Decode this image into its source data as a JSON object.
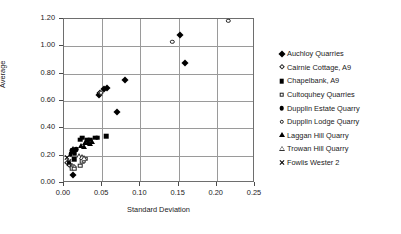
{
  "chart_data": {
    "type": "scatter",
    "title": "",
    "xlabel": "Standard Deviation",
    "ylabel": "Average",
    "xlim": [
      0.0,
      0.25
    ],
    "ylim": [
      0.0,
      1.2
    ],
    "xticks": [
      "0.00",
      "0.05",
      "0.10",
      "0.15",
      "0.20",
      "0.25"
    ],
    "yticks": [
      "0.00",
      "0.20",
      "0.40",
      "0.60",
      "0.80",
      "1.00",
      "1.20"
    ],
    "xtick_values": [
      0.0,
      0.05,
      0.1,
      0.15,
      0.2,
      0.25
    ],
    "ytick_values": [
      0.0,
      0.2,
      0.4,
      0.6,
      0.8,
      1.0,
      1.2
    ],
    "grid": true,
    "legend_position": "right",
    "series": [
      {
        "name": "Auchloy Quarries",
        "marker": "filled-diamond",
        "color": "#000000",
        "points": [
          [
            0.012,
            0.055
          ],
          [
            0.046,
            0.645
          ],
          [
            0.047,
            0.66
          ],
          [
            0.053,
            0.69
          ],
          [
            0.056,
            0.695
          ],
          [
            0.07,
            0.522
          ],
          [
            0.08,
            0.752
          ],
          [
            0.152,
            1.082
          ],
          [
            0.159,
            0.878
          ]
        ]
      },
      {
        "name": "Cairnie Cottage, A9",
        "marker": "open-diamond",
        "color": "#222222",
        "points": [
          [
            0.004,
            0.15
          ],
          [
            0.006,
            0.142
          ],
          [
            0.008,
            0.128
          ],
          [
            0.01,
            0.122
          ],
          [
            0.013,
            0.118
          ],
          [
            0.049,
            0.662
          ]
        ]
      },
      {
        "name": "Chapelbank, A9",
        "marker": "filled-square",
        "color": "#000000",
        "points": [
          [
            0.01,
            0.228
          ],
          [
            0.012,
            0.232
          ],
          [
            0.014,
            0.218
          ],
          [
            0.013,
            0.175
          ],
          [
            0.021,
            0.318
          ],
          [
            0.024,
            0.33
          ],
          [
            0.03,
            0.312
          ],
          [
            0.034,
            0.318
          ],
          [
            0.041,
            0.33
          ],
          [
            0.044,
            0.33
          ],
          [
            0.055,
            0.342
          ]
        ]
      },
      {
        "name": "Cultoquhey Quarries",
        "marker": "open-square",
        "color": "#222222",
        "points": [
          [
            0.01,
            0.11
          ],
          [
            0.013,
            0.105
          ],
          [
            0.021,
            0.128
          ],
          [
            0.024,
            0.16
          ],
          [
            0.026,
            0.162
          ],
          [
            0.028,
            0.178
          ]
        ]
      },
      {
        "name": "Dupplin Estate Quarry",
        "marker": "filled-circle",
        "color": "#000000",
        "points": [
          [
            0.009,
            0.212
          ],
          [
            0.011,
            0.238
          ],
          [
            0.016,
            0.248
          ]
        ]
      },
      {
        "name": "Dupplin Lodge Quarry",
        "marker": "open-circle",
        "color": "#222222",
        "points": [
          [
            0.007,
            0.132
          ],
          [
            0.142,
            1.032
          ],
          [
            0.215,
            1.188
          ]
        ]
      },
      {
        "name": "Laggan Hill Quarry",
        "marker": "filled-triangle",
        "color": "#000000",
        "points": [
          [
            0.01,
            0.236
          ],
          [
            0.012,
            0.246
          ],
          [
            0.014,
            0.24
          ],
          [
            0.022,
            0.272
          ],
          [
            0.026,
            0.262
          ],
          [
            0.028,
            0.29
          ],
          [
            0.031,
            0.296
          ],
          [
            0.034,
            0.288
          ],
          [
            0.037,
            0.302
          ]
        ]
      },
      {
        "name": "Trowan Hill Quarry",
        "marker": "open-triangle",
        "color": "#333333",
        "points": [
          [
            0.02,
            0.195
          ],
          [
            0.023,
            0.188
          ],
          [
            0.026,
            0.182
          ]
        ]
      },
      {
        "name": "Fowlis Wester 2",
        "marker": "cross",
        "color": "#000000",
        "points": [
          [
            0.004,
            0.188
          ],
          [
            0.006,
            0.16
          ],
          [
            0.007,
            0.145
          ]
        ]
      }
    ]
  }
}
